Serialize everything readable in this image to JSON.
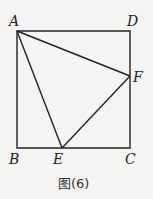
{
  "diagram": {
    "caption": "图(6)",
    "points": {
      "A": {
        "label": "A",
        "x": 17,
        "y": 31
      },
      "B": {
        "label": "B",
        "x": 17,
        "y": 148
      },
      "C": {
        "label": "C",
        "x": 130,
        "y": 148
      },
      "D": {
        "label": "D",
        "x": 130,
        "y": 31
      },
      "E": {
        "label": "E",
        "x": 62,
        "y": 148
      },
      "F": {
        "label": "F",
        "x": 130,
        "y": 76
      }
    },
    "segments": [
      "AB",
      "BC",
      "CD",
      "DA",
      "AE",
      "AF",
      "EF"
    ]
  }
}
